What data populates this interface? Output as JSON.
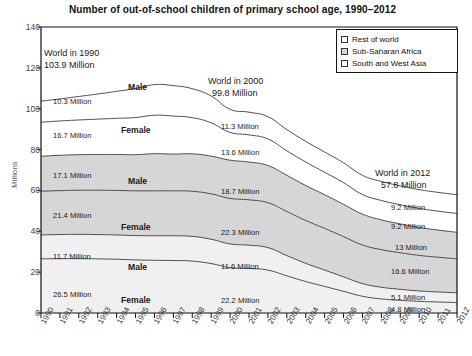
{
  "chart_data": {
    "type": "area",
    "title": "Number of out-of-school children of primary school age, 1990–2012",
    "xlabel": "",
    "ylabel": "Millions",
    "ylim": [
      0,
      140
    ],
    "yticks": [
      0,
      20,
      40,
      60,
      80,
      100,
      120,
      140
    ],
    "grid": false,
    "legend_position": "top-right",
    "stacked": true,
    "x": [
      1990,
      1991,
      1992,
      1993,
      1994,
      1995,
      1996,
      1997,
      1998,
      1999,
      2000,
      2001,
      2002,
      2003,
      2004,
      2005,
      2006,
      2007,
      2008,
      2009,
      2010,
      2011,
      2012
    ],
    "legend": [
      {
        "label": "Rest of world",
        "fill": "#ffffff"
      },
      {
        "label": "Sub-Saharan Africa",
        "fill": "#d6d6d6"
      },
      {
        "label": "South and West Asia",
        "fill": "#f0f0f0"
      }
    ],
    "series": [
      {
        "name": "South and West Asia – Female",
        "region": "South and West Asia",
        "sex": "Female",
        "fill": "#f0f0f0",
        "values": [
          26.5,
          26.6,
          26.6,
          26.5,
          26.3,
          26.0,
          25.8,
          25.7,
          25.4,
          24.2,
          22.2,
          21.8,
          21.0,
          18.2,
          15.4,
          13.0,
          10.6,
          8.2,
          6.9,
          6.2,
          5.7,
          5.4,
          5.1
        ]
      },
      {
        "name": "South and West Asia – Male",
        "region": "South and West Asia",
        "sex": "Male",
        "fill": "#f0f0f0",
        "values": [
          11.7,
          11.8,
          11.9,
          11.9,
          11.9,
          11.9,
          12.0,
          12.1,
          12.1,
          11.9,
          11.6,
          11.4,
          11.0,
          9.9,
          8.9,
          8.0,
          7.1,
          6.2,
          5.7,
          5.4,
          5.1,
          4.9,
          4.8
        ]
      },
      {
        "name": "Sub-Saharan Africa – Female",
        "region": "Sub-Saharan Africa",
        "sex": "Female",
        "fill": "#d6d6d6",
        "values": [
          21.4,
          21.5,
          21.6,
          21.7,
          21.8,
          21.9,
          22.0,
          22.0,
          22.1,
          22.2,
          22.3,
          22.2,
          22.0,
          21.6,
          21.0,
          20.4,
          19.7,
          18.9,
          18.4,
          17.9,
          17.4,
          17.0,
          16.6
        ]
      },
      {
        "name": "Sub-Saharan Africa – Male",
        "region": "Sub-Saharan Africa",
        "sex": "Male",
        "fill": "#d6d6d6",
        "values": [
          17.1,
          17.3,
          17.4,
          17.5,
          17.6,
          17.7,
          18.2,
          18.0,
          18.3,
          18.5,
          18.7,
          18.5,
          18.2,
          17.7,
          17.1,
          16.5,
          15.8,
          15.1,
          14.6,
          14.1,
          13.7,
          13.3,
          13.0
        ]
      },
      {
        "name": "Rest of world – Female",
        "region": "Rest of world",
        "sex": "Female",
        "fill": "#ffffff",
        "values": [
          16.7,
          16.8,
          17.0,
          17.3,
          17.7,
          18.2,
          18.8,
          18.6,
          17.7,
          16.3,
          13.6,
          13.3,
          13.0,
          12.0,
          11.5,
          11.0,
          10.6,
          9.6,
          9.5,
          9.4,
          9.3,
          9.25,
          9.2
        ]
      },
      {
        "name": "Rest of world – Male",
        "region": "Rest of world",
        "sex": "Male",
        "fill": "#ffffff",
        "values": [
          10.3,
          10.8,
          11.5,
          12.3,
          13.2,
          14.2,
          15.0,
          14.9,
          14.2,
          13.1,
          11.3,
          11.1,
          10.9,
          10.4,
          10.1,
          9.9,
          9.7,
          9.4,
          9.3,
          9.25,
          9.2,
          9.2,
          9.2
        ]
      }
    ],
    "totals": {
      "1990": 103.9,
      "2000": 99.8,
      "2012": 57.8
    },
    "annotations": [
      {
        "id": "world-1990",
        "text_line1": "World in 1990",
        "text_line2": "103.9 Million"
      },
      {
        "id": "world-2000",
        "text_line1": "World in 2000",
        "text_line2": "99.8 Million"
      },
      {
        "id": "world-2012",
        "text_line1": "World in 2012",
        "text_line2": "57.8 Million"
      }
    ],
    "value_labels_1990": [
      "10.3 Million",
      "16.7 Million",
      "17.1 Million",
      "21.4 Million",
      "11.7 Million",
      "26.5 Million"
    ],
    "value_labels_2000": [
      "11.3 Million",
      "13.6 Million",
      "18.7 Million",
      "22.3 Million",
      "11.6 Million",
      "22.2 Million"
    ],
    "value_labels_2012": [
      "9.2 Million",
      "9.2 Million",
      "13 Million",
      "16.6 Million",
      "5.1 Million",
      "4.8 Million"
    ],
    "band_labels": [
      "Male",
      "Female",
      "Male",
      "Female",
      "Male",
      "Female"
    ]
  },
  "axis": {
    "y_ticks": [
      "0",
      "20",
      "40",
      "60",
      "80",
      "100",
      "120",
      "140"
    ],
    "y_title": "Millions",
    "x_ticks": [
      "1990",
      "1991",
      "1992",
      "1993",
      "1994",
      "1995",
      "1996",
      "1997",
      "1998",
      "1999",
      "2000",
      "2001",
      "2002",
      "2003",
      "2004",
      "2005",
      "2006",
      "2007",
      "2008",
      "2009",
      "2010",
      "2011",
      "2012"
    ]
  },
  "labels": {
    "title": "Number of out-of-school children of primary school age, 1990–2012",
    "world_1990_l1": "World in 1990",
    "world_1990_l2": "103.9 Million",
    "world_2000_l1": "World in 2000",
    "world_2000_l2": "99.8 Million",
    "world_2012_l1": "World in 2012",
    "world_2012_l2": "57.8 Million",
    "v1990_1": "10.3 Million",
    "v1990_2": "16.7 Million",
    "v1990_3": "17.1 Million",
    "v1990_4": "21.4 Million",
    "v1990_5": "11.7 Million",
    "v1990_6": "26.5 Million",
    "v2000_1": "11.3 Million",
    "v2000_2": "13.6 Million",
    "v2000_3": "18.7 Million",
    "v2000_4": "22.3 Million",
    "v2000_5": "11.6 Million",
    "v2000_6": "22.2 Million",
    "v2012_1": "9.2 Million",
    "v2012_2": "9.2 Million",
    "v2012_3": "13 Million",
    "v2012_4": "16.6 Million",
    "v2012_5": "5.1 Million",
    "v2012_6": "4.8 Million",
    "band_male_1": "Male",
    "band_female_1": "Female",
    "band_male_2": "Male",
    "band_female_2": "Female",
    "band_male_3": "Male",
    "band_female_3": "Female"
  },
  "legend": {
    "items": [
      {
        "label": "Rest of world",
        "fill": "#ffffff"
      },
      {
        "label": "Sub-Saharan Africa",
        "fill": "#d6d6d6"
      },
      {
        "label": "South and West Asia",
        "fill": "#ffffff"
      }
    ]
  },
  "colors": {
    "rest_of_world": "#ffffff",
    "sub_saharan_africa": "#d6d6d6",
    "south_west_asia": "#f0f0f0",
    "axis": "#111111",
    "line": "#3a3a3a"
  }
}
